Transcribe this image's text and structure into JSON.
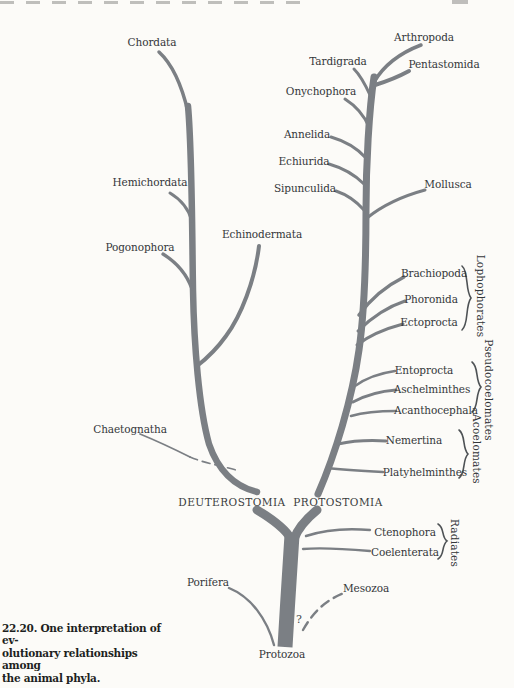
{
  "colors": {
    "branch": "#7b7f84",
    "text": "#34373a",
    "background": "#fcfbf8",
    "brace": "#4e5255"
  },
  "caption": {
    "line1": "22.20. One interpretation of ev-",
    "line2": "olutionary relationships among",
    "line3": "the animal phyla."
  },
  "clades": {
    "deuterostomia": "DEUTEROSTOMIA",
    "protostomia": "PROTOSTOMIA"
  },
  "root": {
    "label": "Protozoa",
    "uncertainty_mark": "?"
  },
  "taxa": {
    "chordata": "Chordata",
    "hemichordata": "Hemichordata",
    "pogonophora": "Pogonophora",
    "echinodermata": "Echinodermata",
    "chaetognatha": "Chaetognatha",
    "arthropoda": "Arthropoda",
    "tardigrada": "Tardigrada",
    "pentastomida": "Pentastomida",
    "onychophora": "Onychophora",
    "annelida": "Annelida",
    "echiurida": "Echiurida",
    "sipunculida": "Sipunculida",
    "mollusca": "Mollusca",
    "brachiopoda": "Brachiopoda",
    "phoronida": "Phoronida",
    "ectoprocta": "Ectoprocta",
    "entoprocta": "Entoprocta",
    "aschelminthes": "Aschelminthes",
    "acanthocephala": "Acanthocephala",
    "nemertina": "Nemertina",
    "platyhelminthes": "Platyhelminthes",
    "ctenophora": "Ctenophora",
    "coelenterata": "Coelenterata",
    "porifera": "Porifera",
    "mesozoa": "Mesozoa",
    "protozoa": "Protozoa"
  },
  "group_labels": {
    "lophophorates": "Lophophorates",
    "pseudocoelomates": "Pseudocoelomates",
    "acoelomates": "Acoelomates",
    "radiates": "Radiates"
  },
  "groups": [
    {
      "label": "Lophophorates",
      "members": [
        "Brachiopoda",
        "Phoronida",
        "Ectoprocta"
      ]
    },
    {
      "label": "Pseudocoelomates",
      "members": [
        "Entoprocta",
        "Aschelminthes",
        "Acanthocephala"
      ]
    },
    {
      "label": "Acoelomates",
      "members": [
        "Nemertina",
        "Platyhelminthes"
      ]
    },
    {
      "label": "Radiates",
      "members": [
        "Ctenophora",
        "Coelenterata"
      ]
    }
  ],
  "lineages": {
    "root": "Protozoa",
    "basal_branches": [
      "Porifera",
      "Mesozoa (dashed, uncertain ?)",
      "Ctenophora",
      "Coelenterata"
    ],
    "deuterostome_line_bottom_to_top": [
      "Chaetognatha (dashed attachment)",
      "Echinodermata",
      "Pogonophora",
      "Hemichordata",
      "Chordata"
    ],
    "protostome_line_bottom_to_top": [
      "Platyhelminthes",
      "Nemertina",
      "Acanthocephala",
      "Aschelminthes",
      "Entoprocta",
      "Ectoprocta",
      "Phoronida",
      "Brachiopoda",
      "Mollusca",
      "Sipunculida",
      "Echiurida",
      "Annelida",
      "Onychophora",
      "Tardigrada",
      "Pentastomida",
      "Arthropoda"
    ]
  }
}
